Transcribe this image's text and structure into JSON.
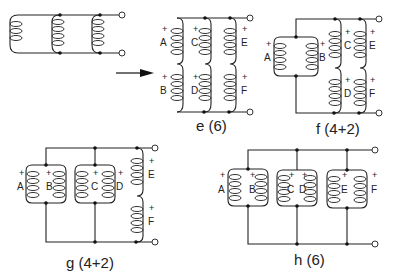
{
  "diagram": {
    "arrow": "right-arrow",
    "circuits": [
      {
        "id": "original",
        "caption": "",
        "windings": []
      },
      {
        "id": "e",
        "caption": "e (6)",
        "windings": [
          "A",
          "B",
          "C",
          "D",
          "E",
          "F"
        ]
      },
      {
        "id": "f",
        "caption": "f (4+2)",
        "windings": [
          "A",
          "B",
          "C",
          "D",
          "E",
          "F"
        ]
      },
      {
        "id": "g",
        "caption": "g (4+2)",
        "windings": [
          "A",
          "B",
          "C",
          "D",
          "E",
          "F"
        ]
      },
      {
        "id": "h",
        "caption": "h (6)",
        "windings": [
          "A",
          "B",
          "C",
          "D",
          "E",
          "F"
        ]
      }
    ],
    "polarity_mark": "+"
  }
}
